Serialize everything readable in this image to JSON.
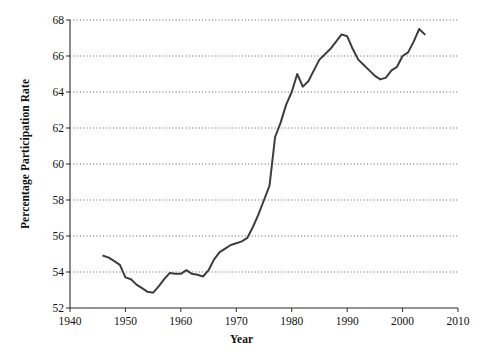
{
  "chart_data": {
    "type": "line",
    "title": "",
    "xlabel": "Year",
    "ylabel": "Percentage Participation Rate",
    "xlim": [
      1940,
      2010
    ],
    "ylim": [
      52,
      68
    ],
    "xticks": [
      1940,
      1950,
      1960,
      1970,
      1980,
      1990,
      2000,
      2010
    ],
    "yticks": [
      52,
      54,
      56,
      58,
      60,
      62,
      64,
      66,
      68
    ],
    "grid": "horizontal-dotted",
    "legend": "none",
    "line_color": "#3d3d3d",
    "series": [
      {
        "name": "Labor force participation rate",
        "x": [
          1946,
          1947,
          1948,
          1949,
          1950,
          1951,
          1952,
          1953,
          1954,
          1955,
          1956,
          1957,
          1958,
          1959,
          1960,
          1961,
          1962,
          1963,
          1964,
          1965,
          1966,
          1967,
          1968,
          1969,
          1970,
          1971,
          1972,
          1973,
          1974,
          1975,
          1976,
          1977,
          1978,
          1979,
          1980,
          1981,
          1982,
          1983,
          1984,
          1985,
          1986,
          1987,
          1988,
          1989,
          1990,
          1991,
          1992,
          1993,
          1994,
          1995,
          1996,
          1997,
          1998,
          1999,
          2000,
          2001,
          2002,
          2003,
          2004
        ],
        "values": [
          54.9,
          54.8,
          54.6,
          54.4,
          53.7,
          53.6,
          53.3,
          53.1,
          52.9,
          52.85,
          53.2,
          53.6,
          53.95,
          53.9,
          53.9,
          54.1,
          53.9,
          53.85,
          53.75,
          54.1,
          54.7,
          55.1,
          55.3,
          55.5,
          55.6,
          55.7,
          55.9,
          56.5,
          57.2,
          58.0,
          58.8,
          61.5,
          62.3,
          63.3,
          64.0,
          65.0,
          64.3,
          64.6,
          65.2,
          65.8,
          66.1,
          66.4,
          66.8,
          67.2,
          67.1,
          66.4,
          65.8,
          65.5,
          65.2,
          64.9,
          64.7,
          64.8,
          65.2,
          65.4,
          66.0,
          66.2,
          66.8,
          67.5,
          67.2
        ]
      }
    ]
  },
  "axes": {
    "x_axis_name": "Year",
    "y_axis_name": "Percentage Participation Rate"
  }
}
